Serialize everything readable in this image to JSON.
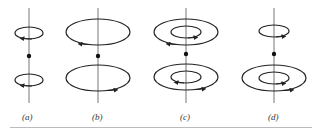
{
  "panels": [
    {
      "label": "(a)",
      "axis_x": 29
    },
    {
      "label": "(b)",
      "axis_x": 98
    },
    {
      "label": "(c)",
      "axis_x": 186
    },
    {
      "label": "(d)",
      "axis_x": 274
    }
  ],
  "colors": {
    "stroke": "#222222",
    "axis": "#777777",
    "rule": "#bbbbbb"
  }
}
